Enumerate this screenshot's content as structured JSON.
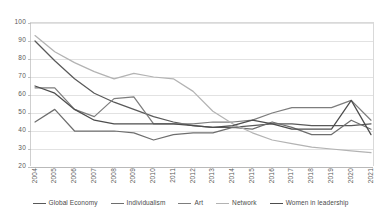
{
  "chart_data": {
    "type": "line",
    "title": "",
    "xlabel": "",
    "ylabel": "",
    "grid": true,
    "legend_position": "bottom",
    "ylim": [
      20,
      100
    ],
    "yticks": [
      20,
      30,
      40,
      50,
      60,
      70,
      80,
      90,
      100
    ],
    "categories": [
      "2004",
      "2005",
      "2006",
      "2007",
      "2008",
      "2009",
      "2010",
      "2011",
      "2012",
      "2013",
      "2014",
      "2015",
      "2016",
      "2017",
      "2018",
      "2019",
      "2020",
      "2021"
    ],
    "series": [
      {
        "name": "Global Economy",
        "color": "#595959",
        "values": [
          90,
          79,
          69,
          61,
          56,
          52,
          48,
          45,
          43,
          42,
          42,
          43,
          44,
          44,
          43,
          43,
          43,
          44
        ]
      },
      {
        "name": "Individualism",
        "color": "#6e6e6e",
        "values": [
          45,
          52,
          40,
          40,
          40,
          39,
          35,
          38,
          39,
          39,
          42,
          41,
          45,
          42,
          38,
          38,
          46,
          41
        ]
      },
      {
        "name": "Art",
        "color": "#7d7d7d",
        "values": [
          64,
          64,
          52,
          48,
          58,
          59,
          44,
          44,
          44,
          45,
          45,
          46,
          50,
          53,
          53,
          53,
          57,
          46
        ]
      },
      {
        "name": "Network",
        "color": "#b3b3b3",
        "values": [
          93,
          84,
          78,
          73,
          69,
          72,
          70,
          69,
          62,
          51,
          44,
          39,
          35,
          33,
          31,
          30,
          29,
          28
        ]
      },
      {
        "name": "Women in leadership",
        "color": "#4d4d4d",
        "values": [
          65,
          61,
          52,
          46,
          44,
          44,
          44,
          44,
          43,
          42,
          43,
          46,
          44,
          41,
          41,
          41,
          57,
          38
        ]
      }
    ]
  },
  "axis": {
    "y_tick_labels": [
      "100",
      "90",
      "80",
      "70",
      "60",
      "50",
      "40",
      "30",
      "20"
    ],
    "x_tick_labels": [
      "2004",
      "2005",
      "2006",
      "2007",
      "2008",
      "2009",
      "2010",
      "2011",
      "2012",
      "2013",
      "2014",
      "2015",
      "2016",
      "2017",
      "2018",
      "2019",
      "2020",
      "2021"
    ]
  },
  "legend": {
    "items": [
      {
        "label": "Global Economy",
        "color": "#595959"
      },
      {
        "label": "Individualism",
        "color": "#6e6e6e"
      },
      {
        "label": "Art",
        "color": "#7d7d7d"
      },
      {
        "label": "Network",
        "color": "#b3b3b3"
      },
      {
        "label": "Women in leadership",
        "color": "#4d4d4d"
      }
    ]
  }
}
